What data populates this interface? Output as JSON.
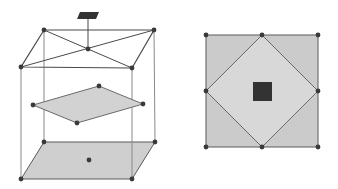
{
  "colors": {
    "line": "#4a4a4a",
    "edge": "#8a8a8a",
    "fill": "#cfcfcf",
    "fill_light": "#dcdcdc",
    "node": "#3a3a3a",
    "dark": "#333333"
  },
  "figures": [
    {
      "name": "cube-projection",
      "description": "Wireframe box with shaded bottom face, shaded middle rhombus plane, and a small dark marker above the top center"
    },
    {
      "name": "top-view",
      "description": "Shaded square with inscribed diamond and a central dark square"
    }
  ]
}
